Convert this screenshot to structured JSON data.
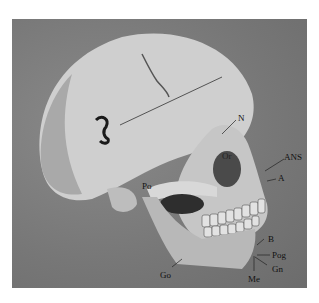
{
  "figure": {
    "landmarks": [
      {
        "id": "N",
        "label": "N"
      },
      {
        "id": "Or",
        "label": "Or"
      },
      {
        "id": "ANS",
        "label": "ANS"
      },
      {
        "id": "A",
        "label": "A"
      },
      {
        "id": "Po",
        "label": "Po"
      },
      {
        "id": "B",
        "label": "B"
      },
      {
        "id": "Pog",
        "label": "Pog"
      },
      {
        "id": "Gn",
        "label": "Gn"
      },
      {
        "id": "Go",
        "label": "Go"
      },
      {
        "id": "Me",
        "label": "Me"
      }
    ],
    "colors": {
      "background": "#7a7a7a",
      "bone": "#d4d4d4",
      "shadow": "#3a3a3a",
      "label": "#111111"
    }
  }
}
